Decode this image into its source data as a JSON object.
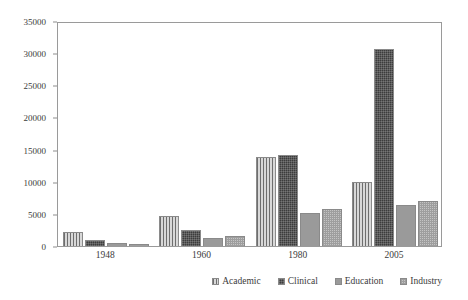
{
  "chart_data": {
    "type": "bar",
    "title": "",
    "subtitle": "",
    "xlabel": "",
    "ylabel": "",
    "categories": [
      "1948",
      "1960",
      "1980",
      "2005"
    ],
    "series": [
      {
        "name": "Academic",
        "pattern": "vertical-stripes",
        "color": "#c9c9c9",
        "values": [
          2200,
          4700,
          13800,
          10000
        ]
      },
      {
        "name": "Clinical",
        "pattern": "dark-checker",
        "color": "#3c3c3c",
        "values": [
          900,
          2500,
          14100,
          30600
        ]
      },
      {
        "name": "Education",
        "pattern": "solid-gray",
        "color": "#9a9a9a",
        "values": [
          400,
          1200,
          5200,
          6400
        ]
      },
      {
        "name": "Industry",
        "pattern": "light-checker",
        "color": "#c4c4c4",
        "values": [
          250,
          1500,
          5700,
          7000
        ]
      }
    ],
    "ylim": [
      0,
      35000
    ],
    "ytick_values": [
      0,
      5000,
      10000,
      15000,
      20000,
      25000,
      30000,
      35000
    ],
    "ytick_labels": [
      "0",
      "5000",
      "10000",
      "15000",
      "20000",
      "25000",
      "30000",
      "35000"
    ],
    "grid": false,
    "legend_position": "bottom-right",
    "legend_entries": [
      "Academic",
      "Clinical",
      "Education",
      "Industry"
    ],
    "frame": true
  }
}
